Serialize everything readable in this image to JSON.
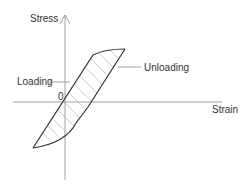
{
  "diagram": {
    "type": "stress-strain hysteresis loop",
    "axes": {
      "y_label": "Stress",
      "x_label": "Strain",
      "origin_label": "0"
    },
    "annotations": {
      "loading": "Loading",
      "unloading": "Unloading"
    },
    "colors": {
      "line": "#333333",
      "axis": "#888888",
      "hatch": "#aaaaaa",
      "text": "#333333"
    }
  }
}
